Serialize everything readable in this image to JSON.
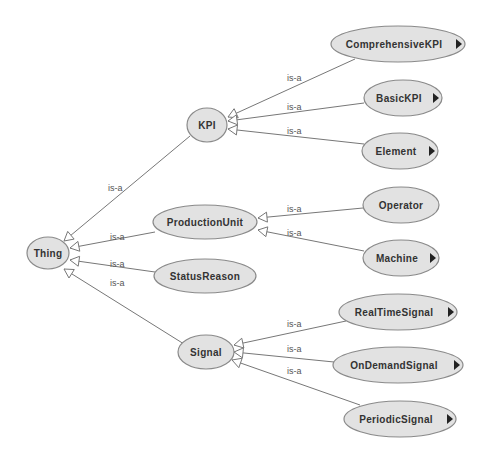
{
  "diagram": {
    "type": "ontology-class-hierarchy",
    "edge_label": "is-a",
    "colors": {
      "node_fill": "#e2e2e2",
      "node_stroke": "#8a8a8a",
      "edge": "#777777",
      "text": "#333333"
    },
    "nodes": [
      {
        "id": "thing",
        "label": "Thing",
        "cx": 48,
        "cy": 253,
        "rx": 21,
        "ry": 16,
        "expandable": false
      },
      {
        "id": "kpi",
        "label": "KPI",
        "cx": 207,
        "cy": 125,
        "rx": 20,
        "ry": 17,
        "expandable": false
      },
      {
        "id": "productionunit",
        "label": "ProductionUnit",
        "cx": 205,
        "cy": 222,
        "rx": 52,
        "ry": 17,
        "expandable": false
      },
      {
        "id": "statusreason",
        "label": "StatusReason",
        "cx": 205,
        "cy": 276,
        "rx": 51,
        "ry": 17,
        "expandable": false
      },
      {
        "id": "signal",
        "label": "Signal",
        "cx": 206,
        "cy": 352,
        "rx": 28,
        "ry": 17,
        "expandable": false
      },
      {
        "id": "comprehensivekpi",
        "label": "ComprehensiveKPI",
        "cx": 398,
        "cy": 44,
        "rx": 67,
        "ry": 18,
        "expandable": true
      },
      {
        "id": "basickpi",
        "label": "BasicKPI",
        "cx": 403,
        "cy": 98,
        "rx": 39,
        "ry": 18,
        "expandable": true
      },
      {
        "id": "element",
        "label": "Element",
        "cx": 400,
        "cy": 151,
        "rx": 38,
        "ry": 18,
        "expandable": true
      },
      {
        "id": "operator",
        "label": "Operator",
        "cx": 401,
        "cy": 205,
        "rx": 38,
        "ry": 18,
        "expandable": false
      },
      {
        "id": "machine",
        "label": "Machine",
        "cx": 401,
        "cy": 258,
        "rx": 38,
        "ry": 18,
        "expandable": true
      },
      {
        "id": "realtimesignal",
        "label": "RealTimeSignal",
        "cx": 398,
        "cy": 312,
        "rx": 59,
        "ry": 18,
        "expandable": true
      },
      {
        "id": "ondemandsignal",
        "label": "OnDemandSignal",
        "cx": 398,
        "cy": 365,
        "rx": 65,
        "ry": 18,
        "expandable": true
      },
      {
        "id": "periodicsignal",
        "label": "PeriodicSignal",
        "cx": 400,
        "cy": 419,
        "rx": 56,
        "ry": 18,
        "expandable": true
      }
    ],
    "edges": [
      {
        "from": "kpi",
        "to": "thing",
        "label": "is-a",
        "x1": 190,
        "y1": 136,
        "x2": 64,
        "y2": 241,
        "lx": 108,
        "ly": 191
      },
      {
        "from": "productionunit",
        "to": "thing",
        "label": "is-a",
        "x1": 155,
        "y1": 232,
        "x2": 70,
        "y2": 248,
        "lx": 110,
        "ly": 240
      },
      {
        "from": "statusreason",
        "to": "thing",
        "label": "is-a",
        "x1": 155,
        "y1": 272,
        "x2": 70,
        "y2": 260,
        "lx": 110,
        "ly": 267
      },
      {
        "from": "signal",
        "to": "thing",
        "label": "is-a",
        "x1": 184,
        "y1": 344,
        "x2": 64,
        "y2": 269,
        "lx": 110,
        "ly": 286
      },
      {
        "from": "comprehensivekpi",
        "to": "kpi",
        "label": "is-a",
        "x1": 355,
        "y1": 59,
        "x2": 228,
        "y2": 117,
        "lx": 287,
        "ly": 81
      },
      {
        "from": "basickpi",
        "to": "kpi",
        "label": "is-a",
        "x1": 364,
        "y1": 103,
        "x2": 228,
        "y2": 121,
        "lx": 287,
        "ly": 110
      },
      {
        "from": "element",
        "to": "kpi",
        "label": "is-a",
        "x1": 364,
        "y1": 144,
        "x2": 228,
        "y2": 129,
        "lx": 287,
        "ly": 134
      },
      {
        "from": "operator",
        "to": "productionunit",
        "label": "is-a",
        "x1": 363,
        "y1": 208,
        "x2": 258,
        "y2": 218,
        "lx": 287,
        "ly": 212
      },
      {
        "from": "machine",
        "to": "productionunit",
        "label": "is-a",
        "x1": 364,
        "y1": 251,
        "x2": 258,
        "y2": 230,
        "lx": 287,
        "ly": 236
      },
      {
        "from": "realtimesignal",
        "to": "signal",
        "label": "is-a",
        "x1": 346,
        "y1": 321,
        "x2": 234,
        "y2": 345,
        "lx": 287,
        "ly": 327
      },
      {
        "from": "ondemandsignal",
        "to": "signal",
        "label": "is-a",
        "x1": 334,
        "y1": 362,
        "x2": 234,
        "y2": 352,
        "lx": 287,
        "ly": 352
      },
      {
        "from": "periodicsignal",
        "to": "signal",
        "label": "is-a",
        "x1": 360,
        "y1": 405,
        "x2": 232,
        "y2": 360,
        "lx": 287,
        "ly": 374
      }
    ]
  }
}
